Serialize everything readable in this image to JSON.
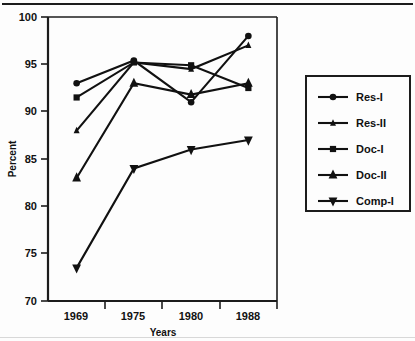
{
  "chart_data": {
    "type": "line",
    "title": "",
    "xlabel": "Years",
    "ylabel": "Percent",
    "categories": [
      "1969",
      "1975",
      "1980",
      "1988"
    ],
    "ylim": [
      70,
      100
    ],
    "yticks": [
      70,
      75,
      80,
      85,
      90,
      95,
      100
    ],
    "grid": false,
    "legend_position": "right",
    "series": [
      {
        "name": "Res-I",
        "marker": "circle",
        "values": [
          93.0,
          95.4,
          91.0,
          98.0
        ]
      },
      {
        "name": "Res-II",
        "marker": "small-triangle",
        "values": [
          88.0,
          95.2,
          94.5,
          97.0
        ]
      },
      {
        "name": "Doc-I",
        "marker": "square",
        "values": [
          91.5,
          95.2,
          94.9,
          92.5
        ]
      },
      {
        "name": "Doc-II",
        "marker": "triangle-up",
        "values": [
          83.0,
          93.0,
          91.8,
          93.0
        ]
      },
      {
        "name": "Comp-I",
        "marker": "triangle-down",
        "values": [
          73.5,
          84.0,
          86.0,
          87.0
        ]
      }
    ]
  },
  "axis": {
    "y_label": "Percent",
    "x_label": "Years",
    "y_tick_labels": [
      "100",
      "95",
      "90",
      "85",
      "80",
      "75",
      "70"
    ],
    "x_tick_labels": [
      "1969",
      "1975",
      "1980",
      "1988"
    ]
  },
  "legend": {
    "entries": [
      {
        "label": "Res-I"
      },
      {
        "label": "Res-II"
      },
      {
        "label": "Doc-I"
      },
      {
        "label": "Doc-II"
      },
      {
        "label": "Comp-I"
      }
    ]
  },
  "colors": {
    "ink": "#111111",
    "background": "#fdfdfd",
    "axis": "#1c1c1c"
  }
}
